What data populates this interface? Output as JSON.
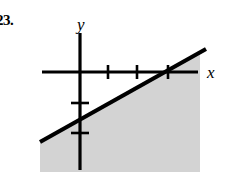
{
  "figure": {
    "problem_number": "23.",
    "background_color": "#ffffff",
    "ink_color": "#000000",
    "shade_color": "#d3d3d3"
  },
  "chart_data": {
    "type": "line",
    "title": "",
    "subtitle": "",
    "xlabel": "x",
    "ylabel": "y",
    "grid": false,
    "legend": null,
    "axis_style": "cartesian-crosshair",
    "origin_px": {
      "x": 80,
      "y": 72
    },
    "unit_px": {
      "x": 29.5,
      "y": 30
    },
    "xaxis": {
      "label": "x",
      "label_px": {
        "x": 207,
        "y": 78
      },
      "start_px": 42,
      "end_px": 198,
      "tick_px": [
        108,
        137,
        168
      ],
      "tick_values": [
        1,
        2,
        3
      ],
      "tick_labels": [
        "",
        "",
        ""
      ],
      "tick_half_length_px": 7
    },
    "yaxis": {
      "label": "y",
      "label_px": {
        "x": 77,
        "y": 30
      },
      "start_px": 33,
      "end_px": 170,
      "tick_px": [
        103,
        133
      ],
      "tick_values": [
        -1,
        -2
      ],
      "tick_labels": [
        "",
        ""
      ],
      "tick_half_length_px": 9
    },
    "series": [
      {
        "name": "boundary-line",
        "style": "solid",
        "stroke_width_px": 4.2,
        "color": "#000000",
        "x_intercept": 3,
        "y_intercept": -1.5,
        "slope": 0.5,
        "endpoints_px": [
          {
            "x": 40,
            "y": 142
          },
          {
            "x": 206,
            "y": 49
          }
        ]
      }
    ],
    "shaded_region": {
      "name": "solution-region",
      "description": "region below and right of the line",
      "relation": "below-line",
      "color": "#d3d3d3",
      "bounds_px": {
        "left": 40,
        "right": 200,
        "top": 49,
        "bottom": 172
      },
      "polygon_px": [
        [
          40,
          143
        ],
        [
          200,
          53
        ],
        [
          200,
          172
        ],
        [
          40,
          172
        ]
      ]
    },
    "ylim": [
      -3.3,
      1.3
    ],
    "xlim": [
      -1.3,
      4.0
    ]
  }
}
